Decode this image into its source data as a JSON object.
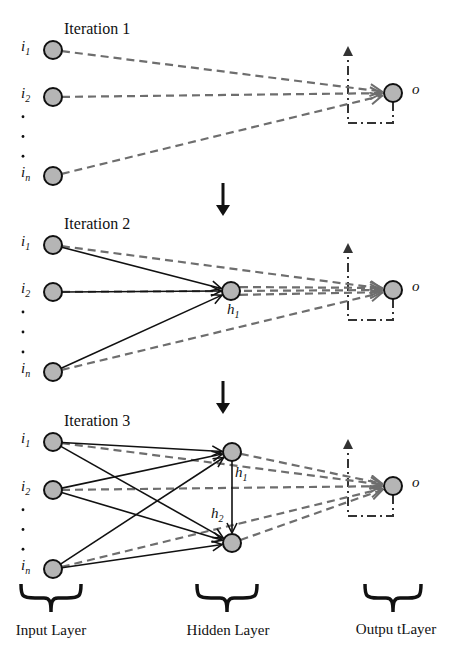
{
  "iterations": [
    {
      "title": "Iteration 1",
      "inputs": [
        {
          "label": "i",
          "sub": "1",
          "x": 53,
          "y": 50
        },
        {
          "label": "i",
          "sub": "2",
          "x": 53,
          "y": 97
        },
        {
          "label": "i",
          "sub": "n",
          "x": 53,
          "y": 176
        }
      ],
      "hidden": [],
      "output": {
        "label": "o",
        "x": 393,
        "y": 93
      },
      "solid_edges": [],
      "dashed_edges": [
        [
          0,
          "o"
        ],
        [
          1,
          "o"
        ],
        [
          2,
          "o"
        ]
      ]
    },
    {
      "title": "Iteration 2",
      "inputs": [
        {
          "label": "i",
          "sub": "1",
          "x": 53,
          "y": 245
        },
        {
          "label": "i",
          "sub": "2",
          "x": 53,
          "y": 292
        },
        {
          "label": "i",
          "sub": "n",
          "x": 53,
          "y": 372
        }
      ],
      "hidden": [
        {
          "label": "h",
          "sub": "1",
          "x": 231,
          "y": 291
        }
      ],
      "output": {
        "label": "o",
        "x": 393,
        "y": 290
      },
      "solid_edges": [
        [
          0,
          "h0"
        ],
        [
          1,
          "h0"
        ],
        [
          2,
          "h0"
        ]
      ],
      "dashed_edges": [
        [
          0,
          "o"
        ],
        [
          1,
          "o"
        ],
        [
          2,
          "o"
        ],
        [
          "h0",
          "o"
        ]
      ]
    },
    {
      "title": "Iteration 3",
      "inputs": [
        {
          "label": "i",
          "sub": "1",
          "x": 53,
          "y": 442
        },
        {
          "label": "i",
          "sub": "2",
          "x": 53,
          "y": 490
        },
        {
          "label": "i",
          "sub": "n",
          "x": 53,
          "y": 569
        }
      ],
      "hidden": [
        {
          "label": "h",
          "sub": "1",
          "x": 232,
          "y": 452
        },
        {
          "label": "h",
          "sub": "2",
          "x": 232,
          "y": 543
        }
      ],
      "output": {
        "label": "o",
        "x": 393,
        "y": 486
      },
      "solid_edges": [
        [
          0,
          "h0"
        ],
        [
          1,
          "h0"
        ],
        [
          2,
          "h0"
        ],
        [
          0,
          "h1"
        ],
        [
          1,
          "h1"
        ],
        [
          2,
          "h1"
        ],
        [
          "h0",
          "h1"
        ]
      ],
      "dashed_edges": [
        [
          0,
          "o"
        ],
        [
          1,
          "o"
        ],
        [
          2,
          "o"
        ],
        [
          "h0",
          "o"
        ],
        [
          "h1",
          "o"
        ]
      ]
    }
  ],
  "layers": {
    "input": "Input Layer",
    "hidden": "Hidden Layer",
    "output": "Outpu tLayer"
  },
  "colors": {
    "node_fill": "#b5b5b5",
    "node_stroke": "#111111",
    "dashed_edge": "#6e6e6e",
    "solid_edge": "#111111"
  }
}
